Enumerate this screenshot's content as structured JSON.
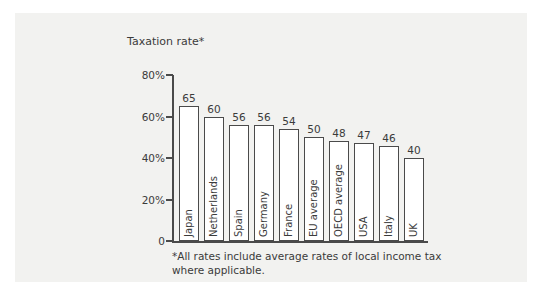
{
  "panel": {
    "background": "#f2f2f0",
    "page_background": "#ffffff"
  },
  "chart_data": {
    "type": "bar",
    "title": "Taxation rate*",
    "xlabel": "",
    "ylabel": "",
    "ylim": [
      0,
      80
    ],
    "ytick_labels": [
      "0",
      "20%",
      "40%",
      "60%",
      "80%"
    ],
    "ytick_values": [
      0,
      20,
      40,
      60,
      80
    ],
    "grid": false,
    "legend": "none",
    "value_labels": true,
    "categories": [
      "Japan",
      "Netherlands",
      "Spain",
      "Germany",
      "France",
      "EU average",
      "OECD average",
      "USA",
      "Italy",
      "UK"
    ],
    "values": [
      65,
      60,
      56,
      56,
      54,
      50,
      48,
      47,
      46,
      40
    ],
    "value_label_texts": [
      "65",
      "60",
      "56",
      "56",
      "54",
      "50",
      "48",
      "47",
      "46",
      "40"
    ],
    "bar_fill": "#ffffff",
    "bar_outline": "#4a4a4a",
    "axis_color": "#4a4a4a",
    "text_color": "#3b3b3b",
    "annotation": "*All rates include average rates of local income tax where applicable."
  },
  "footnote": {
    "text": "*All rates include average rates of local income tax where applicable."
  }
}
